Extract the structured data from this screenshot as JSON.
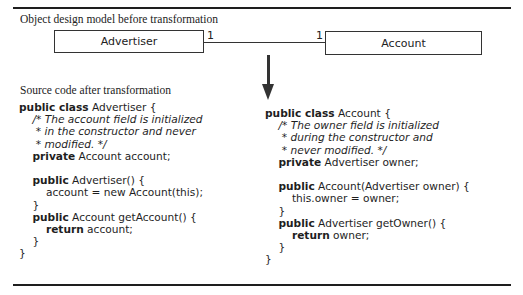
{
  "figure": {
    "top_caption": "Object design model before transformation",
    "bottom_caption": "Source code after transformation"
  },
  "uml": {
    "class_left": {
      "name": "Advertiser",
      "multiplicity": "1"
    },
    "class_right": {
      "name": "Account",
      "multiplicity": "1"
    },
    "association": "one-to-one",
    "arrow": "down"
  },
  "code_left": {
    "lines": [
      [
        {
          "t": "public class",
          "k": "kw"
        },
        {
          "t": " Advertiser {"
        }
      ],
      [
        {
          "t": "    "
        },
        {
          "t": "/* The account field is initialized",
          "k": "cm"
        }
      ],
      [
        {
          "t": "     "
        },
        {
          "t": "* in the constructor and never",
          "k": "cm"
        }
      ],
      [
        {
          "t": "     "
        },
        {
          "t": "* modified. */",
          "k": "cm"
        }
      ],
      [
        {
          "t": "    "
        },
        {
          "t": "private",
          "k": "kw"
        },
        {
          "t": " Account account;"
        }
      ],
      [
        {
          "t": ""
        }
      ],
      [
        {
          "t": "    "
        },
        {
          "t": "public",
          "k": "kw"
        },
        {
          "t": " Advertiser() {"
        }
      ],
      [
        {
          "t": "        account = new Account(this);"
        }
      ],
      [
        {
          "t": "    }"
        }
      ],
      [
        {
          "t": "    "
        },
        {
          "t": "public",
          "k": "kw"
        },
        {
          "t": " Account getAccount() {"
        }
      ],
      [
        {
          "t": "        "
        },
        {
          "t": "return",
          "k": "kw"
        },
        {
          "t": " account;"
        }
      ],
      [
        {
          "t": "    }"
        }
      ],
      [
        {
          "t": "}"
        }
      ]
    ]
  },
  "code_right": {
    "lines": [
      [
        {
          "t": "public class",
          "k": "kw"
        },
        {
          "t": " Account {"
        }
      ],
      [
        {
          "t": "    "
        },
        {
          "t": "/* The owner field is initialized",
          "k": "cm"
        }
      ],
      [
        {
          "t": "     "
        },
        {
          "t": "* during the constructor and",
          "k": "cm"
        }
      ],
      [
        {
          "t": "     "
        },
        {
          "t": "* never modified. */",
          "k": "cm"
        }
      ],
      [
        {
          "t": "    "
        },
        {
          "t": "private",
          "k": "kw"
        },
        {
          "t": " Advertiser owner;"
        }
      ],
      [
        {
          "t": ""
        }
      ],
      [
        {
          "t": "    "
        },
        {
          "t": "public",
          "k": "kw"
        },
        {
          "t": " Account(Advertiser owner) {"
        }
      ],
      [
        {
          "t": "        this.owner = owner;"
        }
      ],
      [
        {
          "t": "    }"
        }
      ],
      [
        {
          "t": "    "
        },
        {
          "t": "public",
          "k": "kw"
        },
        {
          "t": " Advertiser getOwner() {"
        }
      ],
      [
        {
          "t": "        "
        },
        {
          "t": "return",
          "k": "kw"
        },
        {
          "t": " owner;"
        }
      ],
      [
        {
          "t": "    }"
        }
      ],
      [
        {
          "t": "}"
        }
      ]
    ]
  },
  "colors": {
    "ink": "#1e1e1e",
    "background": "#ffffff"
  }
}
